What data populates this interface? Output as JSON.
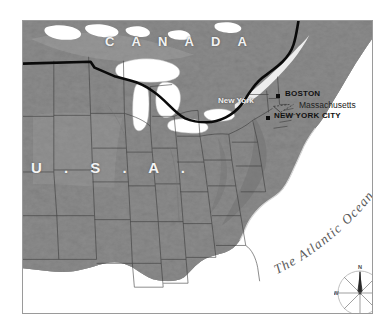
{
  "figure": {
    "kind": "reference-map",
    "background_color": "#ffffff",
    "frame": {
      "border_color": "#9a9a9a",
      "x": 22,
      "y": 20,
      "width": 351,
      "height": 294
    }
  },
  "palette": {
    "land": "#8a8a8a",
    "land_light": "#a2a2a2",
    "land_dark": "#6f6f6f",
    "water": "#ffffff",
    "state_border": "#3a3a3a",
    "international_border": "#0a0a0a",
    "label_light": "#f2f2f2",
    "label_dark": "#111111",
    "ocean_label": "#5a5a5a",
    "compass": "#8f8f8f"
  },
  "labels": {
    "countries": [
      {
        "name": "canada",
        "text": "C A N A D A",
        "style": "light-spaced",
        "x": 104,
        "y": 34
      },
      {
        "name": "usa",
        "text": "U . S . A .",
        "style": "light-spaced",
        "x": 30,
        "y": 158
      }
    ],
    "states": [
      {
        "name": "new-york",
        "text": "New York",
        "x": 217,
        "y": 99
      }
    ],
    "cities": [
      {
        "name": "boston",
        "text": "BOSTON",
        "x": 285,
        "y": 92,
        "marker_x": 277,
        "marker_y": 95
      },
      {
        "name": "new-york-city",
        "text": "NEW YORK CITY",
        "x": 273,
        "y": 114,
        "marker_x": 266,
        "marker_y": 117
      }
    ],
    "regions": [
      {
        "name": "massachusetts",
        "text": "Massachusetts",
        "x": 297,
        "y": 103,
        "leader": true
      }
    ],
    "water_bodies": [
      {
        "name": "atlantic-ocean",
        "text": "The Atlantic Ocean",
        "style": "curved-italic-serif"
      }
    ]
  },
  "compass_rose": {
    "name": "compass-rose",
    "center_x": 336,
    "center_y": 270,
    "radius": 24,
    "directions": {
      "north": "N",
      "south": "S",
      "east": "E",
      "west": "W"
    },
    "ray_count": 8,
    "needle_points": "north"
  }
}
